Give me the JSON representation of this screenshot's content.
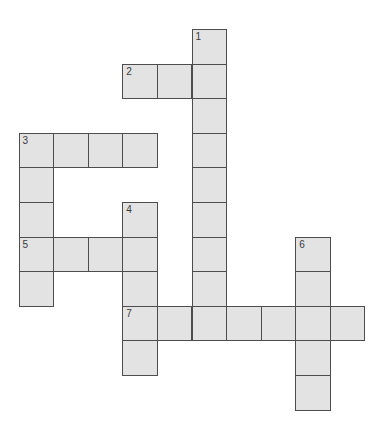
{
  "puzzle": {
    "grid": {
      "origin_x": 18.5,
      "origin_y": 29,
      "pitch": 34.6,
      "cell_fill": "#e3e3e3",
      "border_color": "#4d4d4d"
    },
    "clues": [
      {
        "number": "1",
        "direction": "down",
        "col": 5,
        "row": 0,
        "length": 9
      },
      {
        "number": "2",
        "direction": "across",
        "col": 3,
        "row": 1,
        "length": 3
      },
      {
        "number": "3",
        "direction": "across",
        "col": 0,
        "row": 3,
        "length": 4
      },
      {
        "number": "3",
        "direction": "down",
        "col": 0,
        "row": 3,
        "length": 5
      },
      {
        "number": "4",
        "direction": "down",
        "col": 3,
        "row": 5,
        "length": 5
      },
      {
        "number": "5",
        "direction": "across",
        "col": 0,
        "row": 6,
        "length": 4
      },
      {
        "number": "6",
        "direction": "down",
        "col": 8,
        "row": 6,
        "length": 5
      },
      {
        "number": "7",
        "direction": "across",
        "col": 3,
        "row": 8,
        "length": 7
      }
    ]
  }
}
